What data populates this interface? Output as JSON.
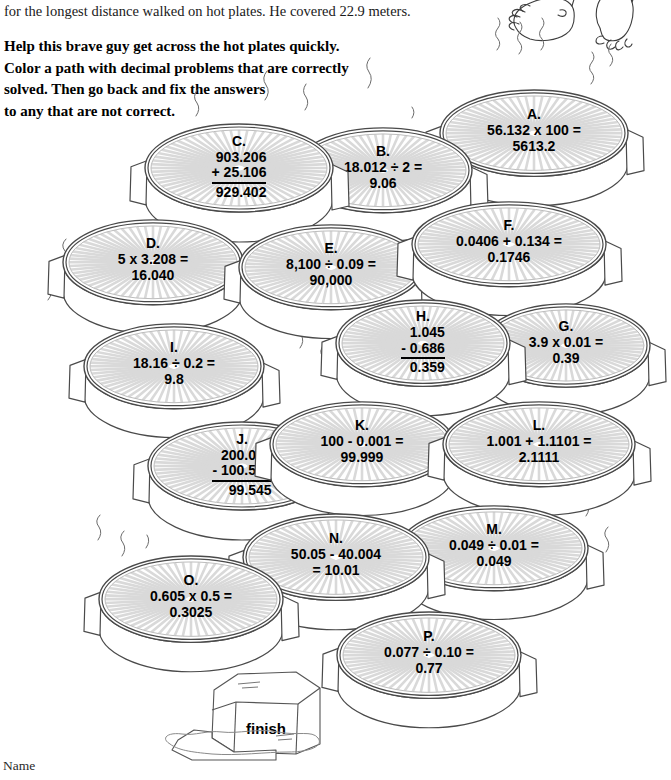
{
  "worksheet": {
    "intro_text": "for the longest distance walked on hot plates. He covered 22.9 meters.",
    "instructions": [
      "Help this brave guy get across the hot plates quickly.",
      "Color a path with decimal problems that are correctly",
      "solved. Then go back and fix the answers",
      "to any that are not correct."
    ],
    "name_label": "Name",
    "finish_label": "finish",
    "colors": {
      "ink": "#000000",
      "plate_outline": "#4a4a4a",
      "plate_stripe": "#d9d9d9",
      "paper": "#ffffff"
    }
  },
  "plates": [
    {
      "id": "A",
      "label": "A.",
      "format": "inline",
      "line1": "56.132 x 100 =",
      "line2": "5613.2",
      "x": 444,
      "y": 92,
      "w": 180,
      "h": 98
    },
    {
      "id": "B",
      "label": "B.",
      "format": "inline",
      "line1": "18.012 ÷ 2 =",
      "line2": "9.06",
      "x": 298,
      "y": 130,
      "w": 170,
      "h": 96
    },
    {
      "id": "C",
      "label": "C.",
      "format": "stacked",
      "top": "903.206",
      "mid": "+  25.106",
      "sum": "929.402",
      "x": 149,
      "y": 126,
      "w": 180,
      "h": 100
    },
    {
      "id": "D",
      "label": "D.",
      "format": "inline",
      "line1": "5 x 3.208 =",
      "line2": "16.040",
      "x": 67,
      "y": 222,
      "w": 172,
      "h": 96
    },
    {
      "id": "E",
      "label": "E.",
      "format": "inline",
      "line1": "8,100 ÷ 0.09 =",
      "line2": "90,000",
      "x": 243,
      "y": 227,
      "w": 176,
      "h": 96
    },
    {
      "id": "F",
      "label": "F.",
      "format": "inline",
      "line1": "0.0406 + 0.134 =",
      "line2": "0.1746",
      "x": 416,
      "y": 204,
      "w": 186,
      "h": 96
    },
    {
      "id": "G",
      "label": "G.",
      "format": "inline",
      "line1": "3.9 x 0.01 =",
      "line2": "0.39",
      "x": 486,
      "y": 306,
      "w": 160,
      "h": 94
    },
    {
      "id": "H",
      "label": "H.",
      "format": "stacked",
      "top": "1.045",
      "mid": "- 0.686",
      "sum": "0.359",
      "x": 340,
      "y": 302,
      "w": 166,
      "h": 98
    },
    {
      "id": "I",
      "label": "I.",
      "format": "inline",
      "line1": "18.16 ÷ 0.2 =",
      "line2": "9.8",
      "x": 88,
      "y": 326,
      "w": 172,
      "h": 96
    },
    {
      "id": "J",
      "label": "J.",
      "format": "stacked",
      "top": "200.050",
      "mid": "- 100.505",
      "sum": "99.545",
      "x": 152,
      "y": 424,
      "w": 180,
      "h": 100
    },
    {
      "id": "K",
      "label": "K.",
      "format": "inline",
      "line1": "100 - 0.001 =",
      "line2": "99.999",
      "x": 274,
      "y": 404,
      "w": 176,
      "h": 96
    },
    {
      "id": "L",
      "label": "L.",
      "format": "inline",
      "line1": "1.001 + 1.1101 =",
      "line2": "2.1111",
      "x": 447,
      "y": 404,
      "w": 184,
      "h": 96
    },
    {
      "id": "M",
      "label": "M.",
      "format": "inline",
      "line1": "0.049 ÷ 0.01 =",
      "line2": "0.049",
      "x": 404,
      "y": 508,
      "w": 180,
      "h": 96
    },
    {
      "id": "N",
      "label": "N.",
      "format": "inline",
      "line1": "50.05 - 40.004",
      "line2": "= 10.01",
      "x": 247,
      "y": 516,
      "w": 178,
      "h": 98
    },
    {
      "id": "O",
      "label": "O.",
      "format": "inline",
      "line1": "0.605 x 0.5 =",
      "line2": "0.3025",
      "x": 103,
      "y": 558,
      "w": 176,
      "h": 98
    },
    {
      "id": "P",
      "label": "P.",
      "format": "inline",
      "line1": "0.077 ÷ 0.10 =",
      "line2": "0.77",
      "x": 341,
      "y": 614,
      "w": 176,
      "h": 98
    }
  ]
}
